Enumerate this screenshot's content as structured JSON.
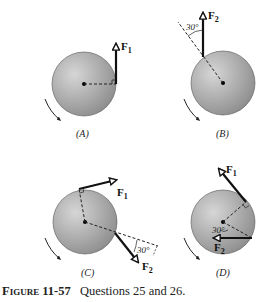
{
  "figure": {
    "number_label": "Figure 11-57",
    "caption_text": "Questions 25 and 26."
  },
  "panels": [
    {
      "id": "A",
      "label": "(A)",
      "forces": [
        {
          "name": "F",
          "subscript": "1"
        }
      ],
      "angle": null
    },
    {
      "id": "B",
      "label": "(B)",
      "forces": [
        {
          "name": "F",
          "subscript": "2"
        }
      ],
      "angle": "30°"
    },
    {
      "id": "C",
      "label": "(C)",
      "forces": [
        {
          "name": "F",
          "subscript": "1"
        },
        {
          "name": "F",
          "subscript": "2"
        }
      ],
      "angle": "30°"
    },
    {
      "id": "D",
      "label": "(D)",
      "forces": [
        {
          "name": "F",
          "subscript": "1"
        },
        {
          "name": "F",
          "subscript": "2"
        }
      ],
      "angle": "30°"
    }
  ],
  "colors": {
    "disk_light": "#d4d4d4",
    "disk_dark": "#8e8e8e",
    "line": "#111111"
  }
}
